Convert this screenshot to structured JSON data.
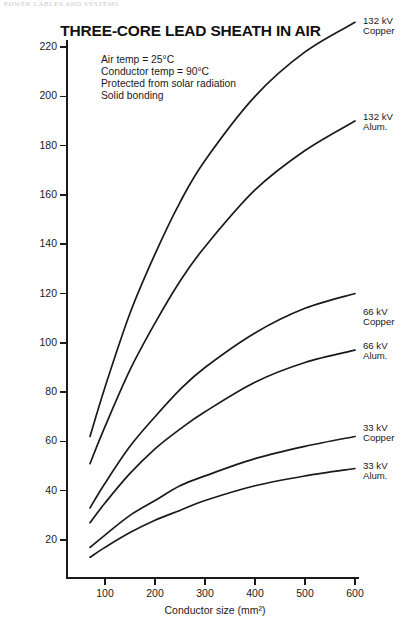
{
  "page_header": "POWER CABLES AND SYSTEMS",
  "notes": [
    "Air temp  =  25°C",
    "Conductor temp  =  90°C",
    "Protected from solar radiation",
    "Solid bonding"
  ],
  "chart_data": {
    "type": "line",
    "title": "THREE-CORE LEAD SHEATH IN AIR",
    "xlabel": "Conductor size (mm²)",
    "ylabel": "Power (MVA)",
    "xlim": [
      60,
      620
    ],
    "ylim": [
      0,
      230
    ],
    "xticks": [
      100,
      200,
      300,
      400,
      500,
      600
    ],
    "yticks": [
      20,
      40,
      60,
      80,
      100,
      120,
      140,
      160,
      180,
      200,
      220
    ],
    "grid": false,
    "legend_position": "right-inline-labels",
    "x": [
      70,
      100,
      150,
      200,
      250,
      300,
      400,
      500,
      600
    ],
    "series": [
      {
        "name": "132 kV Copper",
        "label_line1": "132 kV",
        "label_line2": "Copper",
        "values": [
          62,
          82,
          112,
          136,
          157,
          174,
          200,
          218,
          230
        ]
      },
      {
        "name": "132 kV Alum.",
        "label_line1": "132 kV",
        "label_line2": "Alum.",
        "values": [
          51,
          66,
          89,
          108,
          125,
          139,
          162,
          178,
          190
        ]
      },
      {
        "name": "66 kV Copper",
        "label_line1": "66 kV",
        "label_line2": "Copper",
        "values": [
          33,
          43,
          58,
          70,
          81,
          90,
          104,
          114,
          120
        ]
      },
      {
        "name": "66 kV Alum.",
        "label_line1": "66 kV",
        "label_line2": "Alum.",
        "values": [
          27,
          35,
          47,
          57,
          65,
          72,
          84,
          92,
          97
        ]
      },
      {
        "name": "33 kV Copper",
        "label_line1": "33 kV",
        "label_line2": "Copper",
        "values": [
          17,
          22,
          30,
          36,
          42,
          46,
          53,
          58,
          62
        ]
      },
      {
        "name": "33 kV Alum.",
        "label_line1": "33 kV",
        "label_line2": "Alum.",
        "values": [
          13,
          17,
          23,
          28,
          32,
          36,
          42,
          46,
          49
        ]
      }
    ]
  }
}
